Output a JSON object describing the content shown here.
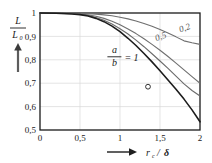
{
  "chart_data": {
    "type": "line",
    "title": "",
    "subtitle": "",
    "xlabel": "r_c / δ",
    "ylabel": "L / L₀",
    "xlabel_parts": {
      "var": "r",
      "sub": "c",
      "slash": "/",
      "denom": "δ"
    },
    "ylabel_parts": {
      "num": "L",
      "den": "L",
      "den_sub": "0"
    },
    "xlim": [
      0,
      2
    ],
    "ylim": [
      0.5,
      1.0
    ],
    "grid": true,
    "legend_position": "inline-curve-labels",
    "xticks": [
      0,
      0.5,
      1,
      1.5,
      2
    ],
    "xtick_labels": [
      "0",
      "0,5",
      "1",
      "1,5",
      "2"
    ],
    "yticks": [
      0.5,
      0.6,
      0.7,
      0.8,
      0.9,
      1.0
    ],
    "ytick_labels": [
      "0,5",
      "0,6",
      "0,7",
      "0,8",
      "0,9",
      "1"
    ],
    "annotations": [
      {
        "name": "ab-ratio",
        "num": "a",
        "den": "b",
        "eq": "=",
        "value": "1",
        "x": 0.93,
        "y": 0.815
      },
      {
        "name": "marker-circle",
        "shape": "open-circle",
        "x": 1.35,
        "y": 0.685
      }
    ],
    "series": [
      {
        "name": "0,2",
        "label": "0,2",
        "color": "#6f6f6f",
        "width": 1.1,
        "label_x": 1.82,
        "label_y": 0.925,
        "x": [
          0,
          0.2,
          0.4,
          0.6,
          0.7,
          0.8,
          0.9,
          1.0,
          1.1,
          1.2,
          1.3,
          1.4,
          1.5,
          1.6,
          1.7,
          1.8,
          1.9,
          2.0
        ],
        "y": [
          1.0,
          1.0,
          0.999,
          0.997,
          0.995,
          0.992,
          0.988,
          0.982,
          0.975,
          0.966,
          0.955,
          0.943,
          0.929,
          0.914,
          0.898,
          0.881,
          0.873,
          0.866
        ]
      },
      {
        "name": "0,5",
        "label": "0,5",
        "color": "#6f6f6f",
        "width": 1.1,
        "label_x": 1.52,
        "label_y": 0.888,
        "x": [
          0,
          0.2,
          0.4,
          0.5,
          0.6,
          0.7,
          0.8,
          0.9,
          1.0,
          1.1,
          1.2,
          1.3,
          1.4,
          1.5,
          1.6,
          1.7,
          1.8,
          1.9,
          2.0
        ],
        "y": [
          1.0,
          1.0,
          0.998,
          0.996,
          0.992,
          0.986,
          0.977,
          0.965,
          0.95,
          0.932,
          0.912,
          0.89,
          0.866,
          0.841,
          0.814,
          0.786,
          0.757,
          0.728,
          0.7
        ]
      },
      {
        "name": "intermediate",
        "label": "",
        "color": "#6a6a6a",
        "width": 1.1,
        "label_x": null,
        "label_y": null,
        "x": [
          0,
          0.2,
          0.4,
          0.5,
          0.6,
          0.7,
          0.8,
          0.9,
          1.0,
          1.1,
          1.2,
          1.3,
          1.4,
          1.5,
          1.6,
          1.7,
          1.8,
          1.9,
          2.0
        ],
        "y": [
          1.0,
          0.999,
          0.997,
          0.994,
          0.989,
          0.981,
          0.969,
          0.953,
          0.933,
          0.91,
          0.884,
          0.856,
          0.826,
          0.795,
          0.763,
          0.73,
          0.697,
          0.669,
          0.645
        ]
      },
      {
        "name": "1",
        "label": "",
        "color": "#1c1c1c",
        "width": 1.6,
        "label_x": null,
        "label_y": null,
        "x": [
          0,
          0.2,
          0.4,
          0.5,
          0.6,
          0.7,
          0.8,
          0.9,
          1.0,
          1.1,
          1.2,
          1.3,
          1.4,
          1.5,
          1.6,
          1.7,
          1.8,
          1.9,
          2.0
        ],
        "y": [
          1.0,
          0.999,
          0.996,
          0.993,
          0.987,
          0.977,
          0.963,
          0.944,
          0.92,
          0.892,
          0.861,
          0.827,
          0.791,
          0.753,
          0.714,
          0.674,
          0.632,
          0.586,
          0.535
        ]
      }
    ]
  },
  "axes": {
    "y_arrow": "up-arrow",
    "x_arrow": "right-arrow"
  },
  "colors": {
    "frame": "#1a1a1a",
    "grid": "#d8d8d8",
    "text": "#1a1a1a",
    "curve_gray": "#6f6f6f",
    "curve_dark": "#1c1c1c"
  }
}
